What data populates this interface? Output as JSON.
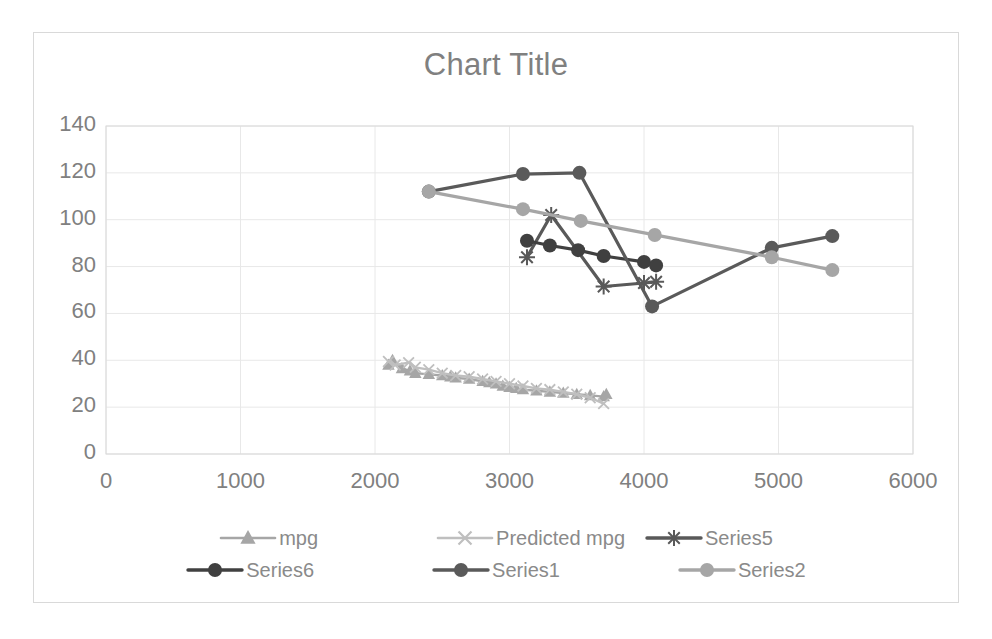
{
  "chart_data": {
    "type": "scatter",
    "title": "Chart Title",
    "xlabel": "",
    "ylabel": "",
    "xlim": [
      0,
      6000
    ],
    "ylim": [
      0,
      140
    ],
    "xticks": [
      0,
      1000,
      2000,
      3000,
      4000,
      5000,
      6000
    ],
    "yticks": [
      0,
      20,
      40,
      60,
      80,
      100,
      120,
      140
    ],
    "grid": true,
    "legend_position": "bottom",
    "series": [
      {
        "name": "mpg",
        "marker": "triangle",
        "color": "#a6a6a6",
        "points": [
          [
            2100,
            38.0
          ],
          [
            2130,
            40.0
          ],
          [
            2200,
            36.5
          ],
          [
            2260,
            35.5
          ],
          [
            2300,
            34.5
          ],
          [
            2400,
            34.0
          ],
          [
            2500,
            33.5
          ],
          [
            2560,
            33.0
          ],
          [
            2600,
            32.5
          ],
          [
            2700,
            32.0
          ],
          [
            2800,
            31.0
          ],
          [
            2850,
            30.5
          ],
          [
            2900,
            30.0
          ],
          [
            2950,
            29.0
          ],
          [
            3000,
            28.5
          ],
          [
            3050,
            28.0
          ],
          [
            3100,
            27.5
          ],
          [
            3200,
            27.0
          ],
          [
            3300,
            26.5
          ],
          [
            3400,
            26.0
          ],
          [
            3500,
            25.5
          ],
          [
            3600,
            25.0
          ],
          [
            3700,
            24.5
          ],
          [
            3720,
            25.5
          ]
        ]
      },
      {
        "name": "Predicted mpg",
        "marker": "x",
        "color": "#bfbfbf",
        "points": [
          [
            2100,
            39.5
          ],
          [
            2150,
            38.0
          ],
          [
            2250,
            39.0
          ],
          [
            2300,
            37.0
          ],
          [
            2400,
            36.0
          ],
          [
            2500,
            34.5
          ],
          [
            2600,
            33.5
          ],
          [
            2700,
            33.0
          ],
          [
            2800,
            32.0
          ],
          [
            2900,
            31.0
          ],
          [
            3000,
            30.0
          ],
          [
            3100,
            29.0
          ],
          [
            3200,
            28.0
          ],
          [
            3300,
            27.5
          ],
          [
            3400,
            26.5
          ],
          [
            3500,
            25.5
          ],
          [
            3600,
            24.0
          ],
          [
            3700,
            21.5
          ]
        ]
      },
      {
        "name": "Series5",
        "marker": "asterisk",
        "color": "#595959",
        "points": [
          [
            3130,
            84.0
          ],
          [
            3310,
            102.0
          ],
          [
            3700,
            71.5
          ],
          [
            4000,
            73.0
          ],
          [
            4090,
            73.5
          ]
        ]
      },
      {
        "name": "Series6",
        "marker": "circle",
        "color": "#404040",
        "points": [
          [
            3130,
            91.0
          ],
          [
            3300,
            89.0
          ],
          [
            3510,
            87.0
          ],
          [
            3700,
            84.5
          ],
          [
            4000,
            82.0
          ],
          [
            4090,
            80.5
          ]
        ]
      },
      {
        "name": "Series1",
        "marker": "circle",
        "color": "#5a5a5a",
        "points": [
          [
            2400,
            112.0
          ],
          [
            3100,
            119.5
          ],
          [
            3520,
            120.0
          ],
          [
            4060,
            63.0
          ],
          [
            4950,
            88.0
          ],
          [
            5400,
            93.0
          ]
        ]
      },
      {
        "name": "Series2",
        "marker": "circle",
        "color": "#a6a6a6",
        "points": [
          [
            2400,
            112.0
          ],
          [
            3100,
            104.5
          ],
          [
            3530,
            99.5
          ],
          [
            4080,
            93.5
          ],
          [
            4950,
            84.0
          ],
          [
            5400,
            78.5
          ]
        ]
      }
    ]
  },
  "legend": {
    "rows": [
      [
        {
          "label": "mpg",
          "marker": "triangle",
          "color": "#a6a6a6"
        },
        {
          "label": "Predicted mpg",
          "marker": "x",
          "color": "#bfbfbf"
        },
        {
          "label": "Series5",
          "marker": "asterisk",
          "color": "#595959"
        }
      ],
      [
        {
          "label": "Series6",
          "marker": "circle",
          "color": "#404040"
        },
        {
          "label": "Series1",
          "marker": "circle",
          "color": "#5a5a5a"
        },
        {
          "label": "Series2",
          "marker": "circle",
          "color": "#a6a6a6"
        }
      ]
    ]
  },
  "style": {
    "grid_color": "#e8e8e8",
    "axis_color": "#d9d9d9",
    "text_color": "#808080",
    "frame_color": "#d9d9d9"
  }
}
